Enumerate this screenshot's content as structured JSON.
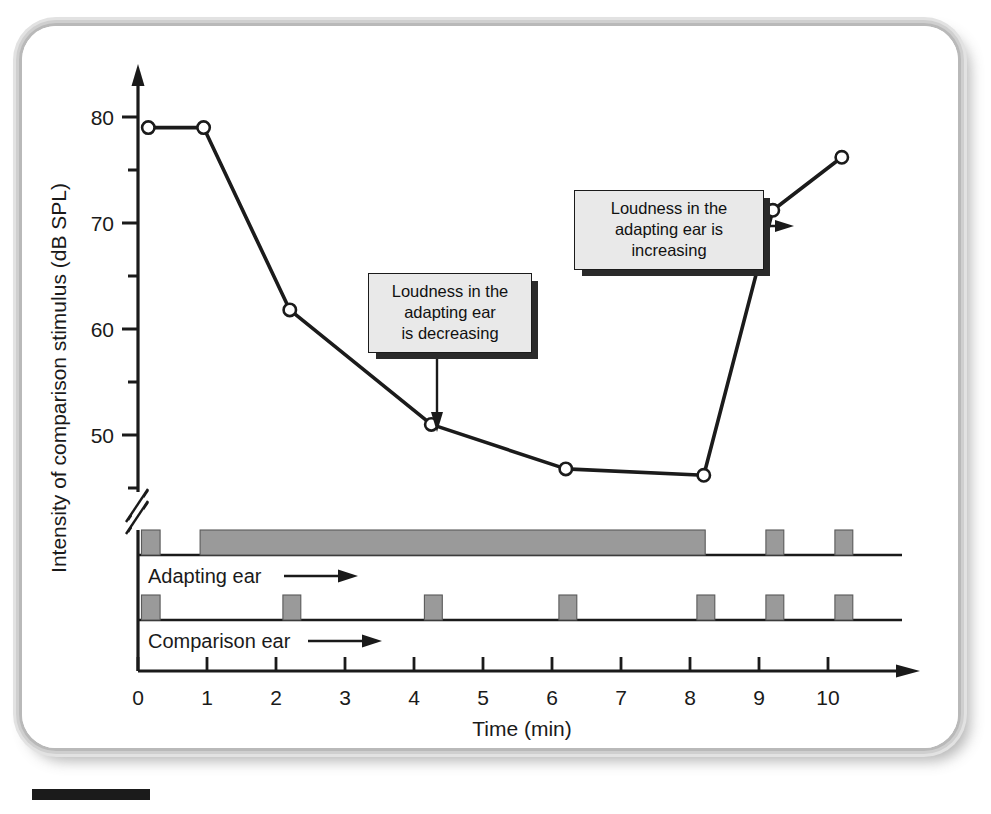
{
  "figure": {
    "background_color": "#ffffff",
    "frame_border_color": "#c2c2c2",
    "caption_rule_color": "#1b1b1b"
  },
  "axes": {
    "y_title": "Intensity of comparison stimulus (dB SPL)",
    "x_title": "Time (min)",
    "y_major_ticks": [
      "80",
      "70",
      "60",
      "50"
    ],
    "y_minor_ticks": [
      "75",
      "65",
      "55",
      "45"
    ],
    "x_ticks": [
      "0",
      "1",
      "2",
      "3",
      "4",
      "5",
      "6",
      "7",
      "8",
      "9",
      "10"
    ],
    "y_axis_break": "//",
    "axis_color": "#1a1a1a"
  },
  "rows": {
    "adapting": {
      "label": "Adapting ear",
      "arrow": "→"
    },
    "comparison": {
      "label": "Comparison ear",
      "arrow": "→"
    }
  },
  "annotations": [
    {
      "id": "decreasing",
      "text": "Loudness in the\nadapting ear\nis decreasing",
      "arrow_direction": "down",
      "points_to_x": 4.25,
      "points_to_y": 51,
      "fill": "#e9e9e9",
      "shadow": "#2a2a2a"
    },
    {
      "id": "increasing",
      "text": "Loudness in the\nadapting ear is\nincreasing",
      "arrow_direction": "right",
      "points_to_x": 9.2,
      "points_to_y": 71,
      "fill": "#e9e9e9",
      "shadow": "#2a2a2a"
    }
  ],
  "chart_data": {
    "type": "line",
    "title": "",
    "xlabel": "Time (min)",
    "ylabel": "Intensity of comparison stimulus (dB SPL)",
    "xlim": [
      0,
      11.1
    ],
    "ylim": [
      44,
      82.5
    ],
    "y_axis_break_below": 46,
    "grid": false,
    "legend": null,
    "marker": "open-circle",
    "line_color": "#1b1b1b",
    "marker_fill": "#ffffff",
    "series": [
      {
        "name": "Comparison stimulus intensity",
        "x": [
          0.15,
          0.95,
          2.2,
          4.25,
          6.2,
          8.2,
          9.2,
          10.2
        ],
        "y": [
          79,
          79,
          61.8,
          51,
          46.8,
          46.2,
          71.2,
          76.2
        ]
      }
    ],
    "stimulus_bars": {
      "adapting_ear": [
        {
          "start": 0.05,
          "end": 0.32
        },
        {
          "start": 0.9,
          "end": 8.22
        },
        {
          "start": 9.1,
          "end": 9.36
        },
        {
          "start": 10.1,
          "end": 10.36
        }
      ],
      "comparison_ear": [
        {
          "start": 0.05,
          "end": 0.32
        },
        {
          "start": 2.1,
          "end": 2.36
        },
        {
          "start": 4.15,
          "end": 4.41
        },
        {
          "start": 6.1,
          "end": 6.36
        },
        {
          "start": 8.1,
          "end": 8.36
        },
        {
          "start": 9.1,
          "end": 9.36
        },
        {
          "start": 10.1,
          "end": 10.36
        }
      ],
      "bar_fill": "#9a9a9a",
      "bar_stroke": "#5a5a5a"
    }
  }
}
